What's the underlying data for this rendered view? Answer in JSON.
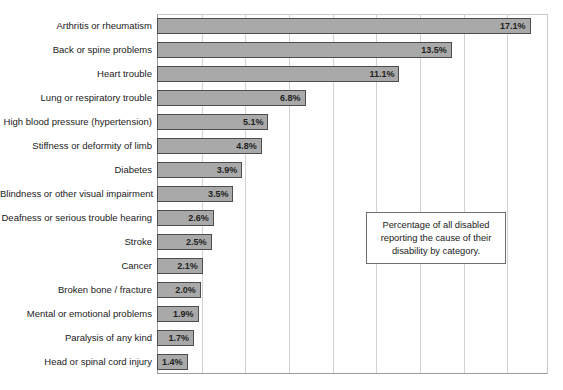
{
  "chart_data": {
    "type": "bar",
    "orientation": "horizontal",
    "title": "",
    "xlabel": "",
    "ylabel": "",
    "xlim": [
      0,
      17.9
    ],
    "grid": true,
    "gridline_values": [
      2,
      4,
      6,
      8,
      10,
      12,
      14,
      16
    ],
    "legend": "none",
    "value_suffix": "%",
    "categories": [
      "Arthritis or rheumatism",
      "Back or spine problems",
      "Heart trouble",
      "Lung or respiratory trouble",
      "High blood pressure (hypertension)",
      "Stiffness or deformity of limb",
      "Diabetes",
      "Blindness or other visual impairment",
      "Deafness or serious trouble hearing",
      "Stroke",
      "Cancer",
      "Broken bone / fracture",
      "Mental or emotional problems",
      "Paralysis of any kind",
      "Head or spinal cord injury"
    ],
    "values": [
      17.1,
      13.5,
      11.1,
      6.8,
      5.1,
      4.8,
      3.9,
      3.5,
      2.6,
      2.5,
      2.1,
      2.0,
      1.9,
      1.7,
      1.4
    ],
    "value_labels": [
      "17.1%",
      "13.5%",
      "11.1%",
      "6.8%",
      "5.1%",
      "4.8%",
      "3.9%",
      "3.5%",
      "2.6%",
      "2.5%",
      "2.1%",
      "2.0%",
      "1.9%",
      "1.7%",
      "1.4%"
    ]
  },
  "annotation": {
    "text": "Percentage of all disabled reporting the cause of their disability by category."
  },
  "style": {
    "bar_fill": "#a9a9a9",
    "bar_border": "#4d4d4d",
    "gridline_color": "#d2d2d2",
    "axis_color": "#9a9a9a",
    "text_color": "#1a1a1a",
    "background": "#ffffff"
  }
}
